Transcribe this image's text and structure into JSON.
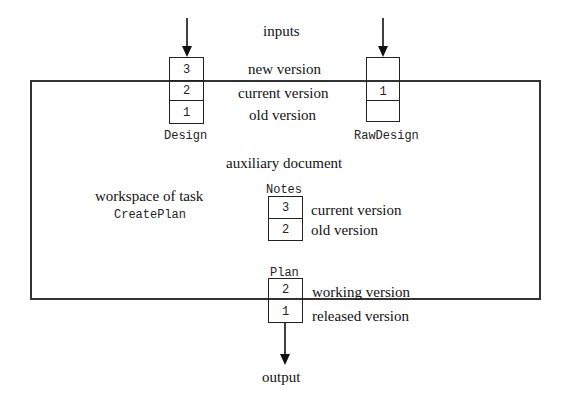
{
  "diagram": {
    "title_inputs": "inputs",
    "title_output": "output",
    "workspace": {
      "label_line1": "workspace of task",
      "label_line2": "CreatePlan"
    },
    "auxiliary_label": "auxiliary document",
    "documents": {
      "design": {
        "name": "Design",
        "cells": [
          "3",
          "2",
          "1"
        ]
      },
      "raw_design": {
        "name": "RawDesign",
        "cells": [
          "",
          "1",
          ""
        ]
      },
      "notes": {
        "name": "Notes",
        "cells": [
          "3",
          "2"
        ]
      },
      "plan": {
        "name": "Plan",
        "cells": [
          "2",
          "1"
        ]
      }
    },
    "version_labels": {
      "new": "new version",
      "current": "current version",
      "old": "old version",
      "notes_current": "current version",
      "notes_old": "old version",
      "working": "working version",
      "released": "released version"
    },
    "colors": {
      "line": "#222222",
      "frame": "#333333",
      "background": "#ffffff"
    }
  }
}
